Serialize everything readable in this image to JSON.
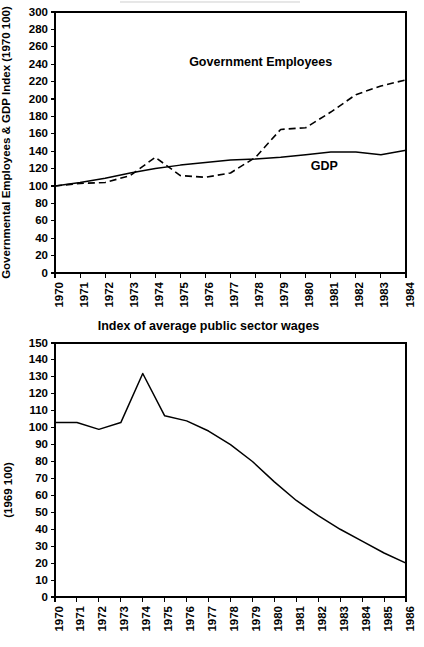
{
  "page": {
    "background": "#ffffff",
    "ink": "#000000",
    "width": 424,
    "height": 647
  },
  "charts": [
    {
      "id": "governmental-employees-gdp",
      "chart_data": {
        "type": "line",
        "title": "",
        "xlabel": "",
        "ylabel": "Governmental Employees & GDP Index (1970 100)",
        "x": [
          1970,
          1971,
          1972,
          1973,
          1974,
          1975,
          1976,
          1977,
          1978,
          1979,
          1980,
          1981,
          1982,
          1983,
          1984
        ],
        "xtick_labels": [
          "1970",
          "1971",
          "1972",
          "1973",
          "1974",
          "1975",
          "1976",
          "1977",
          "1978",
          "1979",
          "1980",
          "1981",
          "1982",
          "1983",
          "1984"
        ],
        "ylim": [
          0,
          300
        ],
        "ytick_labels": [
          "0",
          "20",
          "40",
          "60",
          "80",
          "100",
          "120",
          "140",
          "160",
          "180",
          "200",
          "220",
          "240",
          "260",
          "280",
          "300"
        ],
        "yticks": [
          0,
          20,
          40,
          60,
          80,
          100,
          120,
          140,
          160,
          180,
          200,
          220,
          240,
          260,
          280,
          300
        ],
        "grid": false,
        "legend": "inline-annotations",
        "series": [
          {
            "name": "Government Employees",
            "style": "dashed",
            "label_x": 1975.35,
            "label_y": 238,
            "values": [
              100,
              103,
              104,
              112,
              133,
              112,
              110,
              115,
              133,
              165,
              167,
              185,
              205,
              215,
              222
            ]
          },
          {
            "name": "GDP",
            "style": "solid",
            "label_x": 1980.2,
            "label_y": 118,
            "values": [
              100,
              104,
              109,
              115,
              120,
              124,
              127,
              130,
              131,
              133,
              136,
              139,
              139,
              136,
              141
            ]
          }
        ]
      }
    },
    {
      "id": "index-of-average-public-sector-wages",
      "chart_data": {
        "type": "line",
        "title": "Index of average public sector wages",
        "xlabel": "",
        "ylabel": "(1969 100)",
        "x": [
          1970,
          1971,
          1972,
          1973,
          1974,
          1975,
          1976,
          1977,
          1978,
          1979,
          1980,
          1981,
          1982,
          1983,
          1984,
          1985,
          1986
        ],
        "xtick_labels": [
          "1970",
          "1971",
          "1972",
          "1973",
          "1974",
          "1975",
          "1976",
          "1977",
          "1978",
          "1979",
          "1980",
          "1981",
          "1982",
          "1983",
          "1984",
          "1985",
          "1986"
        ],
        "ylim": [
          0,
          150
        ],
        "yticks": [
          0,
          10,
          20,
          30,
          40,
          50,
          60,
          70,
          80,
          90,
          100,
          110,
          120,
          130,
          140,
          150
        ],
        "ytick_labels": [
          "0",
          "10",
          "20",
          "30",
          "40",
          "50",
          "60",
          "70",
          "80",
          "90",
          "100",
          "110",
          "120",
          "130",
          "140",
          "150"
        ],
        "grid": false,
        "legend": "none",
        "series": [
          {
            "name": "Index of average public sector wages",
            "style": "solid",
            "values": [
              103,
              103,
              99,
              103,
              132,
              107,
              104,
              98,
              90,
              80,
              68,
              57,
              48,
              40,
              33,
              26,
              20
            ]
          }
        ]
      }
    }
  ]
}
